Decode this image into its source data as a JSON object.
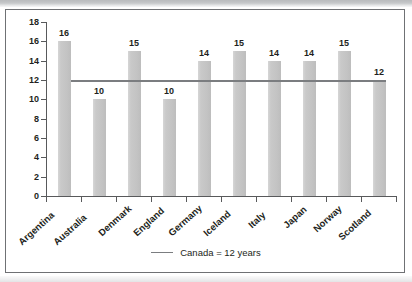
{
  "chart_data": {
    "type": "bar",
    "title": "",
    "xlabel": "",
    "ylabel": "",
    "ylim": [
      0,
      18
    ],
    "ytick_step": 2,
    "yticks": [
      0,
      2,
      4,
      6,
      8,
      10,
      12,
      14,
      16,
      18
    ],
    "grid": false,
    "categories": [
      "Argentina",
      "Australia",
      "Denmark",
      "England",
      "Germany",
      "Iceland",
      "Italy",
      "Japan",
      "Norway",
      "Scotland"
    ],
    "values": [
      16,
      10,
      15,
      10,
      14,
      15,
      14,
      14,
      15,
      12
    ],
    "data_labels": [
      "16",
      "10",
      "15",
      "10",
      "14",
      "15",
      "14",
      "14",
      "15",
      "12"
    ],
    "reference_line": {
      "label": "Canada = 12 years",
      "value": 12,
      "color": "#7b7d80"
    },
    "legend": {
      "position": "bottom",
      "entries": [
        "Canada = 12 years"
      ]
    },
    "colors": {
      "bar": "#c6c6c6",
      "axis": "#58595b",
      "text": "#231f20",
      "frame": "#6f7174",
      "background": "#ffffff"
    }
  },
  "legend": {
    "series_label": "Canada = 12 years"
  }
}
